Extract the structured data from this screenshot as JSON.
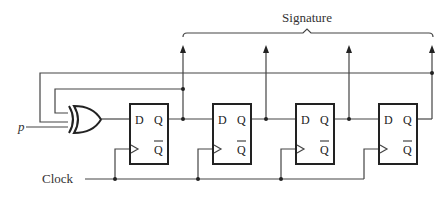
{
  "diagram": {
    "type": "circuit",
    "title": "Signature",
    "input_label": "p",
    "clock_label": "Clock",
    "gate": {
      "type": "XOR",
      "name": "xor-gate"
    },
    "flip_flops": [
      {
        "index": 1,
        "d_label": "D",
        "q_label": "Q",
        "qbar_label": "Q"
      },
      {
        "index": 2,
        "d_label": "D",
        "q_label": "Q",
        "qbar_label": "Q"
      },
      {
        "index": 3,
        "d_label": "D",
        "q_label": "Q",
        "qbar_label": "Q"
      },
      {
        "index": 4,
        "d_label": "D",
        "q_label": "Q",
        "qbar_label": "Q"
      }
    ],
    "outputs_count": 4,
    "feedback": [
      "Q1 -> XOR input",
      "Q4 -> XOR input"
    ],
    "colors": {
      "line": "#444444",
      "background": "#ffffff"
    }
  }
}
